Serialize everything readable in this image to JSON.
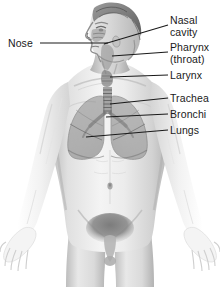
{
  "figure": {
    "background_color": "#ffffff",
    "line_color": "#1a1a1a",
    "text_color": "#1a1a1a",
    "view": "front view, head in three-quarter profile facing viewer's left"
  },
  "labels": [
    {
      "id": "nose",
      "text": "Nose",
      "lines": [
        "Nose"
      ],
      "side": "left",
      "text_x": 8,
      "text_y": 38,
      "leader": {
        "x1": 40,
        "y1": 43,
        "x2": 108,
        "y2": 43
      },
      "anchor_part": "nose"
    },
    {
      "id": "nasal-cavity",
      "text": "Nasal cavity",
      "lines": [
        "Nasal",
        "cavity"
      ],
      "side": "right",
      "text_x": 170,
      "text_y": 15,
      "leader": {
        "x1": 168,
        "y1": 25,
        "x2": 104,
        "y2": 44
      },
      "anchor_part": "nasal cavity"
    },
    {
      "id": "pharynx",
      "text": "Pharynx (throat)",
      "lines": [
        "Pharynx",
        "(throat)"
      ],
      "side": "right",
      "text_x": 170,
      "text_y": 42,
      "leader": {
        "x1": 168,
        "y1": 52,
        "x2": 112,
        "y2": 56
      },
      "anchor_part": "pharynx"
    },
    {
      "id": "larynx",
      "text": "Larynx",
      "lines": [
        "Larynx"
      ],
      "side": "right",
      "text_x": 170,
      "text_y": 70,
      "leader": {
        "x1": 168,
        "y1": 75,
        "x2": 110,
        "y2": 77
      },
      "anchor_part": "larynx"
    },
    {
      "id": "trachea",
      "text": "Trachea",
      "lines": [
        "Trachea"
      ],
      "side": "right",
      "text_x": 170,
      "text_y": 93,
      "leader": {
        "x1": 168,
        "y1": 98,
        "x2": 110,
        "y2": 104
      },
      "anchor_part": "trachea"
    },
    {
      "id": "bronchi",
      "text": "Bronchi",
      "lines": [
        "Bronchi"
      ],
      "side": "right",
      "text_x": 170,
      "text_y": 109,
      "leader": {
        "x1": 168,
        "y1": 114,
        "x2": 106,
        "y2": 117
      },
      "anchor_part": "bronchi"
    },
    {
      "id": "lungs",
      "text": "Lungs",
      "lines": [
        "Lungs"
      ],
      "side": "right",
      "text_x": 170,
      "text_y": 125,
      "leader": {
        "x1": 168,
        "y1": 130,
        "x2": 86,
        "y2": 137
      },
      "anchor_part": "lung"
    }
  ],
  "anatomy_parts": [
    {
      "name": "head",
      "shading": "light gray with dark hair"
    },
    {
      "name": "neck",
      "shading": "light gray"
    },
    {
      "name": "torso",
      "shading": "light gray"
    },
    {
      "name": "arms",
      "shading": "very light gray"
    },
    {
      "name": "hands",
      "shading": "very light gray, palms open"
    },
    {
      "name": "lungs",
      "shading": "medium gray, semi-transparent overlay"
    },
    {
      "name": "trachea",
      "shading": "segmented rings, medium gray"
    },
    {
      "name": "bronchi",
      "shading": "medium gray branches"
    }
  ]
}
